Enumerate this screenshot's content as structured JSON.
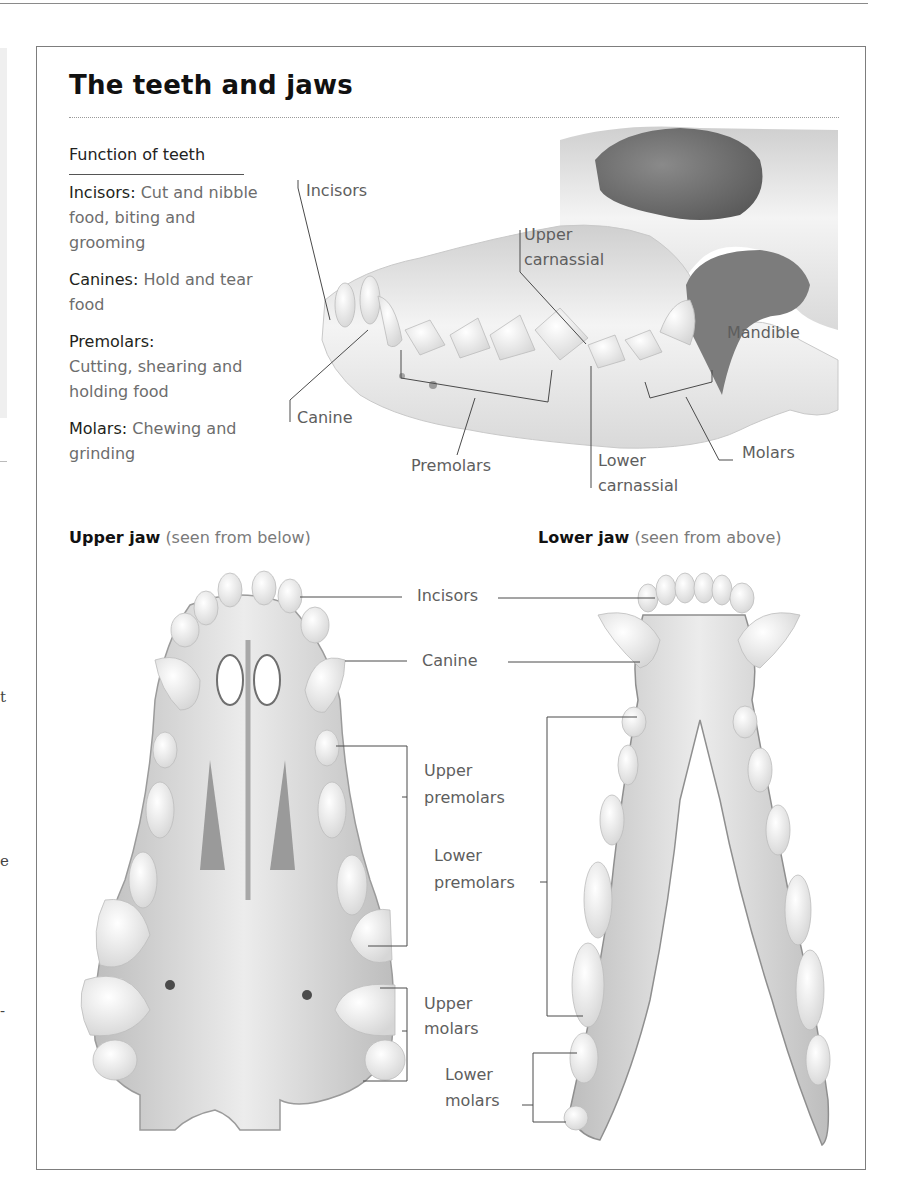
{
  "page": {
    "title": "The teeth and jaws",
    "left_margin_fragments": [
      "t",
      "e",
      "-"
    ]
  },
  "function_of_teeth": {
    "heading": "Function of teeth",
    "items": [
      {
        "term": "Incisors:",
        "description": "Cut and nibble food, biting and grooming"
      },
      {
        "term": "Canines:",
        "description": "Hold and tear food"
      },
      {
        "term": "Premolars:",
        "description": "Cutting, shearing and holding food"
      },
      {
        "term": "Molars:",
        "description": "Chewing and grinding"
      }
    ]
  },
  "skull_side_view": {
    "labels": {
      "incisors": "Incisors",
      "upper_carnassial_1": "Upper",
      "upper_carnassial_2": "carnassial",
      "mandible": "Mandible",
      "canine": "Canine",
      "premolars": "Premolars",
      "lower_carnassial_1": "Lower",
      "lower_carnassial_2": "carnassial",
      "molars": "Molars"
    }
  },
  "upper_jaw": {
    "heading": "Upper jaw",
    "note": "(seen from below)"
  },
  "lower_jaw": {
    "heading": "Lower jaw",
    "note": "(seen from above)"
  },
  "jaw_labels": {
    "incisors": "Incisors",
    "canine": "Canine",
    "upper_premolars_1": "Upper",
    "upper_premolars_2": "premolars",
    "lower_premolars_1": "Lower",
    "lower_premolars_2": "premolars",
    "upper_molars_1": "Upper",
    "upper_molars_2": "molars",
    "lower_molars_1": "Lower",
    "lower_molars_2": "molars"
  }
}
